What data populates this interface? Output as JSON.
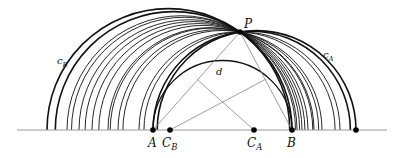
{
  "diagram": {
    "baseline": {
      "y": 130,
      "x1": 17,
      "x2": 387,
      "color": "#999999"
    },
    "P": {
      "x": 240,
      "y": 32,
      "label": "P"
    },
    "points": [
      {
        "id": "A",
        "x": 153,
        "label": "A",
        "sub": ""
      },
      {
        "id": "CB",
        "x": 170,
        "label": "C",
        "sub": "B"
      },
      {
        "id": "CA",
        "x": 254,
        "label": "C",
        "sub": "A"
      },
      {
        "id": "B",
        "x": 292,
        "label": "B",
        "sub": ""
      },
      {
        "id": "R",
        "x": 356,
        "label": "",
        "sub": ""
      }
    ],
    "left_family_feet": [
      47,
      67,
      79,
      92,
      108,
      118,
      139,
      153
    ],
    "right_family_feet": [
      292,
      297,
      302,
      308,
      314,
      322,
      340,
      356
    ],
    "circle_labels": {
      "cB": {
        "text": "c",
        "sub": "B",
        "x": 57,
        "y": 64
      },
      "cA": {
        "text": "c",
        "sub": "A",
        "x": 323,
        "y": 58
      },
      "d": {
        "text": "d",
        "x": 216,
        "y": 75
      }
    }
  }
}
